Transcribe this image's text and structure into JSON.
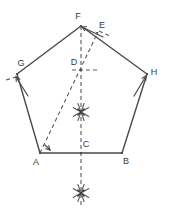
{
  "figure": {
    "colors": {
      "solid_stroke": "#4a4a4a",
      "dashed_stroke": "#5a5a5a",
      "label_text": "#3a3a3a",
      "background": "#ffffff"
    },
    "stroke_widths": {
      "solid": 1.4,
      "dashed": 1.1,
      "arc_mark": 1.1
    }
  },
  "points": [
    {
      "id": "A",
      "label": "A",
      "x": 40,
      "y": 153,
      "label_x": 36,
      "label_y": 163,
      "kind": "pentagon-vertex"
    },
    {
      "id": "B",
      "label": "B",
      "x": 122,
      "y": 153,
      "label_x": 126,
      "label_y": 162,
      "kind": "pentagon-vertex"
    },
    {
      "id": "H",
      "label": "H",
      "x": 147,
      "y": 74,
      "label_x": 154,
      "label_y": 73,
      "kind": "pentagon-vertex"
    },
    {
      "id": "F",
      "label": "F",
      "x": 81,
      "y": 26,
      "label_x": 78,
      "label_y": 17,
      "kind": "pentagon-vertex"
    },
    {
      "id": "G",
      "label": "G",
      "x": 17,
      "y": 74,
      "label_x": 21,
      "label_y": 64,
      "kind": "pentagon-vertex"
    },
    {
      "id": "C",
      "label": "C",
      "x": 81,
      "y": 153,
      "label_x": 86,
      "label_y": 145,
      "kind": "construction-point"
    },
    {
      "id": "D",
      "label": "D",
      "x": 81,
      "y": 70,
      "label_x": 74,
      "label_y": 63,
      "kind": "construction-point"
    },
    {
      "id": "E",
      "label": "E",
      "x": 97,
      "y": 33,
      "label_x": 102,
      "label_y": 26,
      "kind": "construction-point"
    }
  ],
  "solid_edges": [
    {
      "name": "edge-A-B",
      "from": "A",
      "to": "B"
    },
    {
      "name": "edge-B-H",
      "from": "B",
      "to": "H"
    },
    {
      "name": "edge-H-F",
      "from": "H",
      "to": "F"
    },
    {
      "name": "edge-F-G",
      "from": "F",
      "to": "G"
    },
    {
      "name": "edge-G-A",
      "from": "G",
      "to": "A"
    }
  ],
  "dashed_lines": [
    {
      "name": "vertical-axis-F-to-bottom",
      "x1": 81,
      "y1": 26,
      "x2": 81,
      "y2": 205
    },
    {
      "name": "line-A-to-E",
      "x1": 40,
      "y1": 153,
      "x2": 98,
      "y2": 32
    },
    {
      "name": "horizontal-through-D",
      "x1": 72,
      "y1": 70,
      "x2": 100,
      "y2": 70
    },
    {
      "name": "short-dash-left-of-G",
      "x1": 6,
      "y1": 80,
      "x2": 16,
      "y2": 77
    },
    {
      "name": "short-dash-right-of-E",
      "x1": 99,
      "y1": 31,
      "x2": 110,
      "y2": 36
    }
  ],
  "arc_marks": [
    {
      "name": "arc-intersection-center",
      "x": 81,
      "y": 112,
      "radius": 9
    },
    {
      "name": "arc-intersection-bottom",
      "x": 81,
      "y": 193,
      "radius": 9
    }
  ],
  "arrow_marks": [
    {
      "name": "arrow-at-G",
      "x1": 28,
      "y1": 96,
      "x2": 16,
      "y2": 77
    },
    {
      "name": "arrow-at-H",
      "x1": 134,
      "y1": 96,
      "x2": 146,
      "y2": 76
    },
    {
      "name": "arrow-at-F-from-E",
      "x1": 103,
      "y1": 37,
      "x2": 82,
      "y2": 27
    },
    {
      "name": "tick-near-A",
      "x1": 45,
      "y1": 145,
      "x2": 50,
      "y2": 150
    }
  ]
}
